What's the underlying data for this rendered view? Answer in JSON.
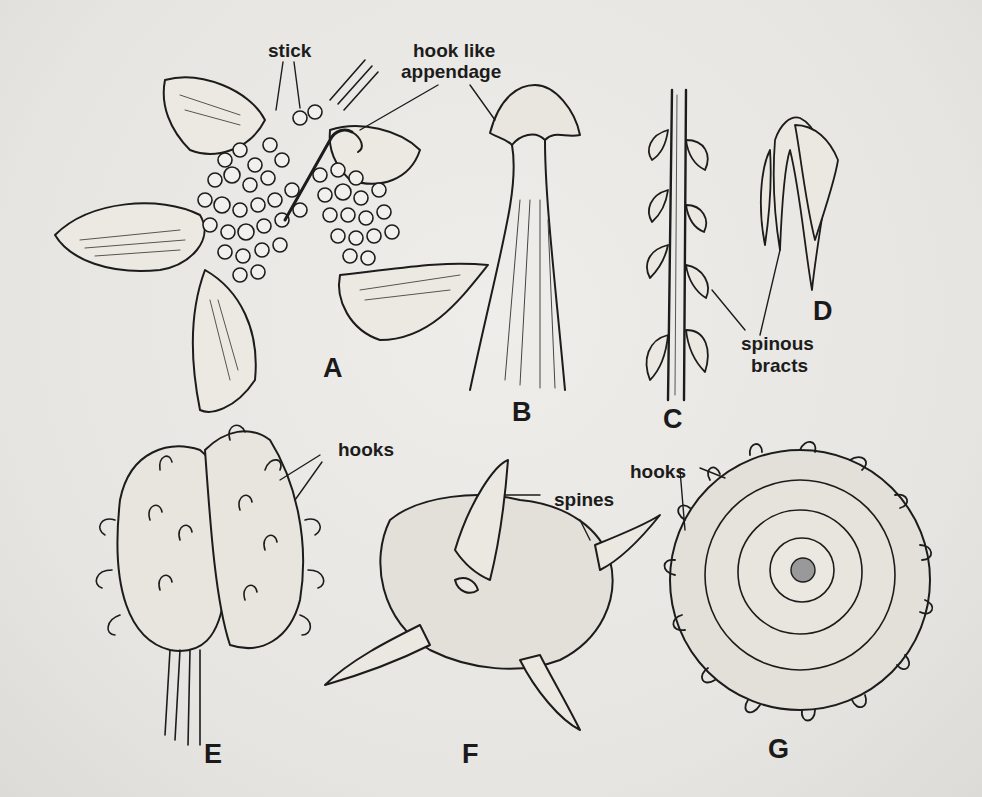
{
  "figure": {
    "panels": [
      {
        "letter": "A",
        "subject": "flower with sticky glands and hook-like appendage"
      },
      {
        "letter": "B",
        "subject": "stamen tip with hook-like appendage"
      },
      {
        "letter": "C",
        "subject": "stem with spinous bracts"
      },
      {
        "letter": "D",
        "subject": "spinous bracts cluster"
      },
      {
        "letter": "E",
        "subject": "fruit covered with hooks"
      },
      {
        "letter": "F",
        "subject": "fruit with spines"
      },
      {
        "letter": "G",
        "subject": "coiled fruit with hooks"
      }
    ],
    "labels": {
      "stick": "stick",
      "hook_like_1": "hook like",
      "hook_like_2": "appendage",
      "spinous_1": "spinous",
      "spinous_2": "bracts",
      "hooks_e": "hooks",
      "spines": "spines",
      "hooks_g": "hooks"
    },
    "colors": {
      "paper": "#e9e8e4",
      "ink": "#1c1c1c",
      "bleed_through": "#c9c8c3"
    }
  }
}
